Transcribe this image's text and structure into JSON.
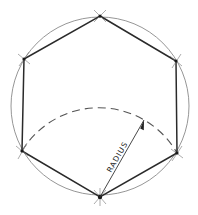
{
  "figure": {
    "label": "RADIUS",
    "circle": {
      "cx": 100,
      "cy": 106,
      "r": 89
    },
    "vertices": [
      {
        "name": "top",
        "x": 100,
        "y": 16
      },
      {
        "name": "upper-right",
        "x": 176,
        "y": 61
      },
      {
        "name": "lower-right",
        "x": 177,
        "y": 153
      },
      {
        "name": "bottom",
        "x": 100,
        "y": 197
      },
      {
        "name": "lower-left",
        "x": 22,
        "y": 151
      },
      {
        "name": "upper-left",
        "x": 24,
        "y": 59
      }
    ],
    "arc": {
      "center": "bottom vertex",
      "radius": 90,
      "style": "dashed"
    },
    "radius_line": {
      "from": [
        100,
        197
      ],
      "to": [
        144,
        120
      ]
    },
    "colors": {
      "hexagon": "#2a2a2a",
      "circle": "#8a8a8a",
      "arc": "#555555",
      "background": "#ffffff"
    }
  }
}
